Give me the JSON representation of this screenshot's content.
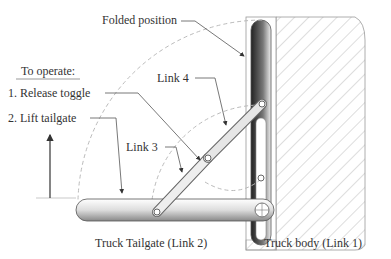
{
  "labels": {
    "folded_position": "Folded position",
    "to_operate": "To operate:",
    "step1": "1.  Release toggle",
    "step2": "2.  Lift tailgate",
    "link4": "Link 4",
    "link3": "Link 3",
    "tailgate": "Truck Tailgate (Link 2)",
    "body": "Truck body (Link 1)"
  },
  "colors": {
    "line": "#555555",
    "dashed": "#bbbbbb",
    "hatch": "#aaaaaa",
    "link_fill": "#e6e6e6"
  }
}
